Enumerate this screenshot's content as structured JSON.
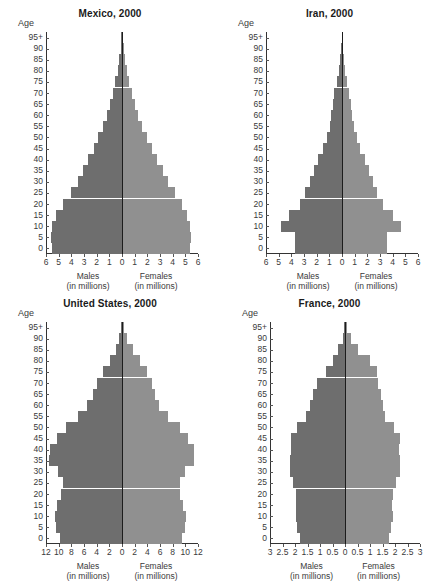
{
  "figure": {
    "age_axis_label": "Age",
    "males_caption_line1": "Males",
    "males_caption_line2": "(in millions)",
    "females_caption_line1": "Females",
    "females_caption_line2": "(in millions)",
    "male_color": "#6e6e6e",
    "female_color": "#909090",
    "axis_color": "#333333",
    "age_groups": [
      "0",
      "5",
      "10",
      "15",
      "20",
      "25",
      "30",
      "35",
      "40",
      "45",
      "50",
      "55",
      "60",
      "65",
      "70",
      "75",
      "80",
      "85",
      "90",
      "95+"
    ]
  },
  "chart_data": [
    {
      "type": "bar",
      "title": "Mexico, 2000",
      "xlabel": "Males (in millions) / Females (in millions)",
      "ylabel": "Age",
      "xlim": [
        -6,
        6
      ],
      "xticks": [
        "6",
        "5",
        "4",
        "3",
        "2",
        "1",
        "0",
        "1",
        "2",
        "3",
        "4",
        "5",
        "6"
      ],
      "xtick_values": [
        -6,
        -5,
        -4,
        -3,
        -2,
        -1,
        0,
        1,
        2,
        3,
        4,
        5,
        6
      ],
      "categories": [
        "0",
        "5",
        "10",
        "15",
        "20",
        "25",
        "30",
        "35",
        "40",
        "45",
        "50",
        "55",
        "60",
        "65",
        "70",
        "75",
        "80",
        "85",
        "90",
        "95+"
      ],
      "series": [
        {
          "name": "Males",
          "values": [
            5.55,
            5.6,
            5.5,
            5.2,
            4.65,
            4.0,
            3.5,
            3.1,
            2.65,
            2.25,
            1.9,
            1.5,
            1.2,
            0.95,
            0.72,
            0.52,
            0.34,
            0.2,
            0.1,
            0.04
          ]
        },
        {
          "name": "Females",
          "values": [
            5.4,
            5.45,
            5.35,
            5.1,
            4.7,
            4.15,
            3.65,
            3.2,
            2.75,
            2.35,
            1.95,
            1.6,
            1.3,
            1.02,
            0.8,
            0.58,
            0.4,
            0.24,
            0.12,
            0.05
          ]
        }
      ]
    },
    {
      "type": "bar",
      "title": "Iran, 2000",
      "xlabel": "Males (in millions) / Females (in millions)",
      "ylabel": "Age",
      "xlim": [
        -6,
        6
      ],
      "xticks": [
        "6",
        "5",
        "4",
        "3",
        "2",
        "1",
        "0",
        "1",
        "2",
        "3",
        "4",
        "5",
        "6"
      ],
      "xtick_values": [
        -6,
        -5,
        -4,
        -3,
        -2,
        -1,
        0,
        1,
        2,
        3,
        4,
        5,
        6
      ],
      "categories": [
        "0",
        "5",
        "10",
        "15",
        "20",
        "25",
        "30",
        "35",
        "40",
        "45",
        "50",
        "55",
        "60",
        "65",
        "70",
        "75",
        "80",
        "85",
        "90",
        "95+"
      ],
      "series": [
        {
          "name": "Males",
          "values": [
            3.75,
            3.75,
            4.8,
            4.15,
            3.35,
            2.9,
            2.55,
            2.25,
            1.9,
            1.5,
            1.2,
            0.95,
            0.85,
            0.75,
            0.6,
            0.42,
            0.25,
            0.12,
            0.05,
            0.02
          ]
        },
        {
          "name": "Females",
          "values": [
            3.55,
            3.55,
            4.65,
            4.0,
            3.25,
            2.8,
            2.45,
            2.15,
            1.8,
            1.45,
            1.15,
            0.92,
            0.82,
            0.72,
            0.58,
            0.4,
            0.24,
            0.12,
            0.05,
            0.02
          ]
        }
      ]
    },
    {
      "type": "bar",
      "title": "United States, 2000",
      "xlabel": "Males (in millions) / Females (in millions)",
      "ylabel": "Age",
      "xlim": [
        -12,
        12
      ],
      "xticks": [
        "12",
        "10",
        "8",
        "6",
        "4",
        "2",
        "0",
        "2",
        "4",
        "6",
        "8",
        "10",
        "12"
      ],
      "xtick_values": [
        -12,
        -10,
        -8,
        -6,
        -4,
        -2,
        0,
        2,
        4,
        6,
        8,
        10,
        12
      ],
      "categories": [
        "0",
        "5",
        "10",
        "15",
        "20",
        "25",
        "30",
        "35",
        "40",
        "45",
        "50",
        "55",
        "60",
        "65",
        "70",
        "75",
        "80",
        "85",
        "90",
        "95+"
      ],
      "series": [
        {
          "name": "Males",
          "values": [
            9.8,
            10.5,
            10.55,
            10.2,
            9.6,
            9.3,
            10.1,
            11.5,
            11.3,
            10.2,
            8.8,
            6.9,
            5.5,
            4.6,
            3.9,
            3.05,
            1.95,
            1.0,
            0.4,
            0.12
          ]
        },
        {
          "name": "Females",
          "values": [
            9.4,
            10.0,
            10.05,
            9.7,
            9.2,
            9.1,
            10.0,
            11.4,
            11.4,
            10.4,
            9.1,
            7.3,
            5.9,
            5.2,
            4.7,
            4.0,
            2.9,
            1.75,
            0.8,
            0.28
          ]
        }
      ]
    },
    {
      "type": "bar",
      "title": "France, 2000",
      "xlabel": "Males (in millions) / Females (in millions)",
      "ylabel": "Age",
      "xlim": [
        -3,
        3
      ],
      "xticks": [
        "3",
        "2.5",
        "2",
        "1.5",
        "1",
        "0.5",
        "0",
        "0.5",
        "1",
        "1.5",
        "2",
        "2.5",
        "3"
      ],
      "xtick_values": [
        -3,
        -2.5,
        -2,
        -1.5,
        -1,
        -0.5,
        0,
        0.5,
        1,
        1.5,
        2,
        2.5,
        3
      ],
      "categories": [
        "0",
        "5",
        "10",
        "15",
        "20",
        "25",
        "30",
        "35",
        "40",
        "45",
        "50",
        "55",
        "60",
        "65",
        "70",
        "75",
        "80",
        "85",
        "90",
        "95+"
      ],
      "series": [
        {
          "name": "Males",
          "values": [
            1.82,
            1.92,
            1.98,
            1.95,
            1.95,
            2.1,
            2.2,
            2.2,
            2.15,
            2.18,
            1.92,
            1.55,
            1.42,
            1.3,
            1.12,
            0.78,
            0.5,
            0.3,
            0.1,
            0.03
          ]
        },
        {
          "name": "Females",
          "values": [
            1.74,
            1.84,
            1.9,
            1.88,
            1.9,
            2.05,
            2.18,
            2.2,
            2.15,
            2.18,
            1.96,
            1.6,
            1.5,
            1.42,
            1.3,
            1.28,
            1.0,
            0.52,
            0.22,
            0.07
          ]
        }
      ]
    }
  ]
}
